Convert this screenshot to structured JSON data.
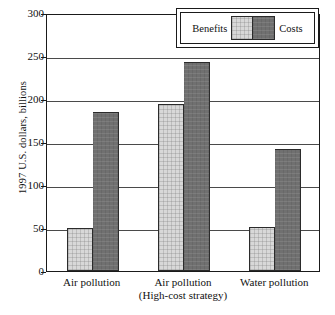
{
  "chart_data": {
    "type": "bar",
    "title": "",
    "subtitle": "",
    "xlabel": "",
    "ylabel": "1997 U.S. dollars, billions",
    "ylim": [
      0,
      300
    ],
    "yticks": [
      0,
      50,
      100,
      150,
      200,
      250,
      300
    ],
    "ytick_labels": [
      "0",
      "50",
      "100",
      "150",
      "200",
      "250",
      "300"
    ],
    "grid": true,
    "legend_position": "top-right",
    "categories": [
      "Air pollution",
      "Air pollution (High-cost strategy)",
      "Water pollution"
    ],
    "category_labels": [
      {
        "line1": "Air pollution",
        "line2": ""
      },
      {
        "line1": "Air pollution",
        "line2": "(High-cost strategy)"
      },
      {
        "line1": "Water pollution",
        "line2": ""
      }
    ],
    "series": [
      {
        "name": "Benefits",
        "color": "#d8d8d8",
        "values": [
          50,
          194,
          51
        ]
      },
      {
        "name": "Costs",
        "color": "#707070",
        "values": [
          185,
          243,
          142
        ]
      }
    ]
  },
  "legend": {
    "benefits_label": "Benefits",
    "costs_label": "Costs"
  },
  "colors": {
    "benefits": "#d8d8d8",
    "costs": "#707070",
    "axis": "#1a1a1a",
    "grid": "#4a4a4a",
    "background": "#ffffff"
  }
}
